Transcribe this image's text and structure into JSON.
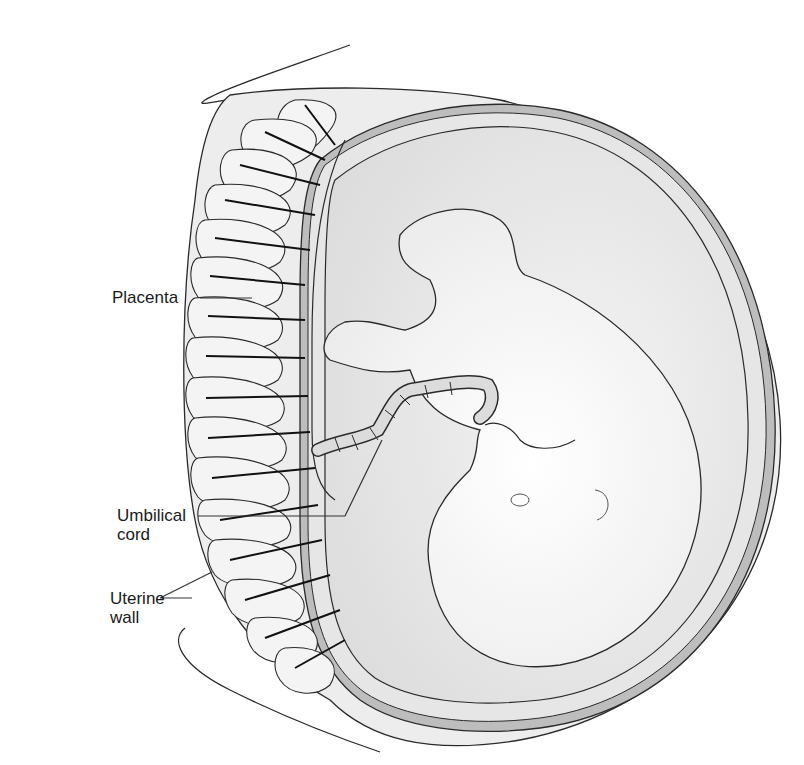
{
  "figure": {
    "colors": {
      "outline": "#2a2a2a",
      "tissue_light": "#f0f0f0",
      "tissue_mid": "#e2e2e2",
      "amniotic_shadow": "#cfcfcf",
      "fetus": "#f6f6f6",
      "membrane_dark": "#9a9a9a"
    }
  },
  "labels": {
    "placenta": "Placenta",
    "umbilical_cord_line1": "Umbilical",
    "umbilical_cord_line2": "cord",
    "uterine_wall_line1": "Uterine",
    "uterine_wall_line2": "wall"
  }
}
